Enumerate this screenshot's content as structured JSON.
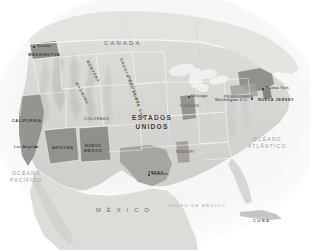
{
  "map": {
    "title": "Mapa de Estados Unidos",
    "projection_note": "grayscale relief map",
    "background_color": "#ffffff",
    "land_color": "#d8d8d4",
    "water_color": "#eeeeec",
    "highlight_color": "#8f8f8f",
    "mid_shade_color": "#b4b4b2",
    "border_color": "#ffffff",
    "text_color": "#4a4a4a",
    "countries": [
      {
        "name": "CANADA",
        "x": 104,
        "y": 40,
        "type": "country"
      },
      {
        "name": "M É X I C O",
        "x": 96,
        "y": 207,
        "type": "country"
      }
    ],
    "main_country": {
      "line1": "ESTADOS",
      "line2": "UNIDOS",
      "x": 144,
      "y": 118
    },
    "oceans": [
      {
        "line1": "OCÉANO",
        "line2": "PACÍFICO",
        "x": 12,
        "y": 172
      },
      {
        "line1": "OCÉANO",
        "line2": "ATLÁNTICO",
        "x": 252,
        "y": 138
      }
    ],
    "gulf": {
      "name": "GOLFO DE MÉXICO",
      "x": 168,
      "y": 204
    },
    "islands": [
      {
        "name": "CUBA",
        "x": 253,
        "y": 219
      }
    ],
    "states_highlighted": [
      {
        "name": "CALIFORNIA",
        "x": 14,
        "y": 119,
        "shade": "dark"
      },
      {
        "name": "ARIZONA",
        "x": 62,
        "y": 146,
        "shade": "dark"
      },
      {
        "name": "NUEVO",
        "name2": "MÉXICO",
        "x": 92,
        "y": 148,
        "shade": "dark"
      },
      {
        "name": "WASHINGTON",
        "x": 32,
        "y": 53,
        "shade": "dark"
      },
      {
        "name": "TEXAS",
        "x": 150,
        "y": 171,
        "shade": "mid"
      },
      {
        "name": "NUEVA JERSEY",
        "x": 262,
        "y": 99,
        "shade": "dark"
      }
    ],
    "state_labels": [
      {
        "text": "MONTANA",
        "x": 88,
        "y": 62,
        "rot": 62
      },
      {
        "text": "WYOMING",
        "x": 78,
        "y": 83,
        "rot": 62
      },
      {
        "text": "DAKOTA DEL NORTE",
        "x": 122,
        "y": 60,
        "rot": 70
      },
      {
        "text": "DAKOTA DEL SUR",
        "x": 128,
        "y": 78,
        "rot": 72
      },
      {
        "text": "COLORADO",
        "x": 94,
        "y": 118,
        "rot": 0
      },
      {
        "text": "ILLINOIS",
        "x": 186,
        "y": 104,
        "rot": 0
      },
      {
        "text": "MÍSISIPI",
        "x": 182,
        "y": 150,
        "rot": 0
      },
      {
        "text": "PENSILVANIA",
        "x": 236,
        "y": 96,
        "rot": 0
      }
    ],
    "cities": [
      {
        "name": "Seattle",
        "x": 37,
        "y": 46,
        "dot_x": 34,
        "dot_y": 47
      },
      {
        "name": "Los Ángeles",
        "x": 16,
        "y": 147,
        "dot_x": 36,
        "dot_y": 147
      },
      {
        "name": "Nueva York",
        "x": 266,
        "y": 88,
        "dot_x": 263,
        "dot_y": 89
      },
      {
        "name": "Houston",
        "x": 152,
        "y": 174,
        "dot_x": 149,
        "dot_y": 175
      },
      {
        "name": "Chicago",
        "x": 191,
        "y": 96,
        "dot_x": 189,
        "dot_y": 97
      },
      {
        "name": "Washington D.C.",
        "x": 232,
        "y": 100,
        "dot_x": 252,
        "dot_y": 99
      }
    ]
  }
}
